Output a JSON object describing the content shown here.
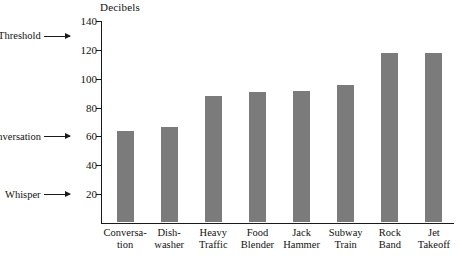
{
  "chart_data": {
    "type": "bar",
    "title": "",
    "subtitle": "",
    "xlabel": "",
    "ylabel": "Decibels",
    "ylim": [
      0,
      140
    ],
    "ytick_interval": 20,
    "yticks": [
      140,
      120,
      100,
      80,
      60,
      40,
      20
    ],
    "grid": false,
    "legend": "none",
    "bar_color": "#7b7b7b",
    "axis_color": "#1a1a1a",
    "categories": [
      "Conversa-\ntion",
      "Dish-\nwasher",
      "Heavy\nTraffic",
      "Food\nBlender",
      "Jack\nHammer",
      "Subway\nTrain",
      "Rock\nBand",
      "Jet\nTakeoff"
    ],
    "values": [
      63,
      66,
      87,
      90,
      91,
      95,
      117,
      117
    ],
    "bars": [
      {
        "label_line1": "Conversa-",
        "label_line2": "tion",
        "value": 63
      },
      {
        "label_line1": "Dish-",
        "label_line2": "washer",
        "value": 66
      },
      {
        "label_line1": "Heavy",
        "label_line2": "Traffic",
        "value": 87
      },
      {
        "label_line1": "Food",
        "label_line2": "Blender",
        "value": 90
      },
      {
        "label_line1": "Jack",
        "label_line2": "Hammer",
        "value": 91
      },
      {
        "label_line1": "Subway",
        "label_line2": "Train",
        "value": 95
      },
      {
        "label_line1": "Rock",
        "label_line2": "Band",
        "value": 117
      },
      {
        "label_line1": "Jet",
        "label_line2": "Takeoff",
        "value": 117
      }
    ],
    "annotations": [
      {
        "name": "pain-threshold",
        "line1": "Pain",
        "line2": "Threshold",
        "value": 130
      },
      {
        "name": "conversation",
        "line1": "Conversation",
        "line2": "",
        "value": 60
      },
      {
        "name": "whisper",
        "line1": "Whisper",
        "line2": "",
        "value": 20
      }
    ]
  },
  "axis": {
    "y_title": "Decibels",
    "tick_labels": [
      "140",
      "120",
      "100",
      "80",
      "60",
      "40",
      "20"
    ]
  },
  "annotations": {
    "pain_line1": "Pain",
    "pain_line2": "Threshold",
    "conversation": "Conversation",
    "whisper": "Whisper"
  }
}
